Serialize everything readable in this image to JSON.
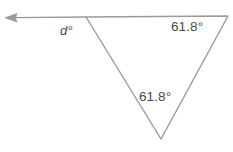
{
  "figure": {
    "type": "geometry-diagram",
    "name": "triangle-with-extended-ray",
    "width": 233,
    "height": 152,
    "background_color": "#ffffff",
    "stroke_color": "#9a9a9a",
    "text_color": "#4a4a4a",
    "stroke_width": 1.4
  },
  "geometry": {
    "vertices": {
      "top_left": {
        "name": "top-left-vertex",
        "x": 86,
        "y": 17
      },
      "top_right": {
        "name": "top-right-vertex",
        "x": 228,
        "y": 16
      },
      "bottom": {
        "name": "bottom-vertex",
        "x": 161,
        "y": 139
      }
    },
    "ray": {
      "name": "extended-ray-left",
      "from_x": 86,
      "from_y": 17,
      "to_x": 6,
      "to_y": 18,
      "arrowhead": "left"
    },
    "sides": [
      {
        "name": "top-side",
        "from": "top_left",
        "to": "top_right"
      },
      {
        "name": "right-side",
        "from": "top_right",
        "to": "bottom"
      },
      {
        "name": "left-side",
        "from": "bottom",
        "to": "top_left"
      }
    ]
  },
  "labels": {
    "exterior_angle": {
      "id": "label-exterior-d",
      "variable": "d",
      "degree_symbol": "°",
      "text": "d°"
    },
    "angle_top_right": {
      "id": "label-angle-top-right",
      "value": "61.8",
      "degree_symbol": "°",
      "text": "61.8°"
    },
    "angle_bottom": {
      "id": "label-angle-bottom",
      "value": "61.8",
      "degree_symbol": "°",
      "text": "61.8°"
    }
  }
}
